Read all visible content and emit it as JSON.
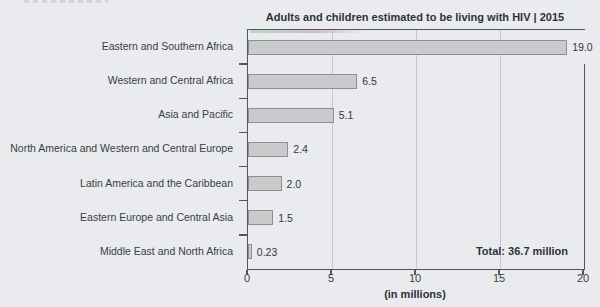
{
  "chart_data": {
    "type": "bar",
    "orientation": "horizontal",
    "title": "Adults and children estimated to be living with HIV | 2015",
    "categories": [
      "Eastern and Southern Africa",
      "Western and Central Africa",
      "Asia and Pacific",
      "North America and Western and Central Europe",
      "Latin America and the Caribbean",
      "Eastern Europe and Central Asia",
      "Middle East and North Africa"
    ],
    "values": [
      19.0,
      6.5,
      5.1,
      2.4,
      2.0,
      1.5,
      0.23
    ],
    "value_labels": [
      "19.0",
      "6.5",
      "5.1",
      "2.4",
      "2.0",
      "1.5",
      "0.23"
    ],
    "xlabel": "(in millions)",
    "x_ticks": [
      0,
      5,
      10,
      15,
      20
    ],
    "x_tick_labels": [
      "0",
      "5",
      "10",
      "15",
      "20"
    ],
    "xlim": [
      0,
      20
    ],
    "grid": "vertical",
    "legend": "none",
    "annotations": {
      "total": "Total: 36.7 million"
    },
    "colors": {
      "page_background": "#e9ebee",
      "bar_fill": "#c8cacc",
      "bar_border": "#8d9093",
      "frame": "#53575d",
      "gridline": "#c4c7cb",
      "text": "#383c42"
    }
  }
}
